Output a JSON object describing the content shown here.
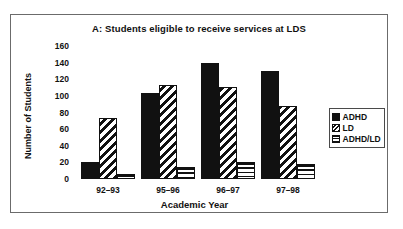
{
  "chart_data": {
    "type": "bar",
    "title": "A: Students eligible to receive services at LDS",
    "xlabel": "Academic Year",
    "ylabel": "Number of Students",
    "categories": [
      "92–93",
      "95–96",
      "96–97",
      "97–98"
    ],
    "series": [
      {
        "name": "ADHD",
        "values": [
          21,
          104,
          139,
          130
        ]
      },
      {
        "name": "LD",
        "values": [
          74,
          113,
          111,
          88
        ]
      },
      {
        "name": "ADHD/LD",
        "values": [
          6,
          15,
          21,
          18
        ]
      }
    ],
    "ylim": [
      0,
      160
    ],
    "yticks": [
      0,
      20,
      40,
      60,
      80,
      100,
      120,
      140,
      160
    ],
    "grid": false,
    "legend_position": "right",
    "colors": {
      "ADHD": "#111111",
      "LD": "#111111",
      "ADHD/LD": "#111111",
      "background": "#ffffff",
      "frame": "#6b6b6b"
    },
    "patterns": {
      "ADHD": "solid-black",
      "LD": "diagonal-hatch",
      "ADHD/LD": "horizontal-stripes"
    }
  },
  "legend": {
    "items": [
      {
        "label": "ADHD",
        "swatch": "solid-black-swatch"
      },
      {
        "label": "LD",
        "swatch": "diagonal-hatch-swatch"
      },
      {
        "label": "ADHD/LD",
        "swatch": "horizontal-stripe-swatch"
      }
    ]
  }
}
